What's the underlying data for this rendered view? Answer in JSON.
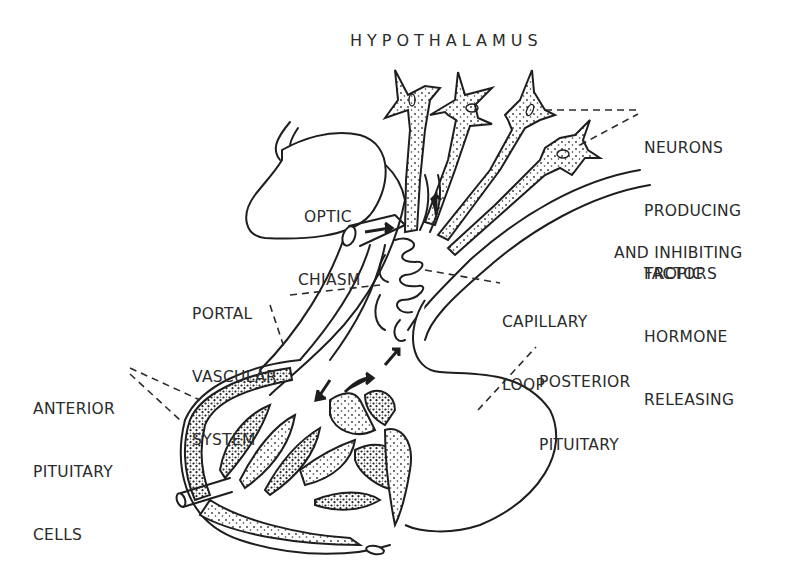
{
  "diagram": {
    "title": "HYPOTHALAMUS",
    "colors": {
      "ink": "#1e1e1e",
      "background": "#ffffff"
    },
    "labels": {
      "neurons": [
        "NEURONS",
        "PRODUCING",
        "TROPIC",
        "HORMONE",
        "RELEASING",
        "AND INHIBITING",
        "FACTORS"
      ],
      "optic_chiasm": [
        "OPTIC",
        "CHIASM"
      ],
      "portal_vascular_system": [
        "PORTAL",
        "VASCULAR",
        "SYSTEM"
      ],
      "capillary_loop": [
        "CAPILLARY",
        "LOOP"
      ],
      "anterior_pituitary_cells": [
        "ANTERIOR",
        "PITUITARY",
        "CELLS"
      ],
      "posterior_pituitary": [
        "POSTERIOR",
        "PITUITARY"
      ]
    },
    "structures": [
      "hypothalamic-neurons",
      "optic-chiasm",
      "pituitary-stalk",
      "portal-vessels",
      "capillary-loops",
      "anterior-pituitary",
      "posterior-pituitary"
    ]
  }
}
